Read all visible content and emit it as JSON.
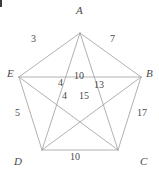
{
  "figure": {
    "shape": "regular-pentagon-with-all-diagonals",
    "stroke_color": "#a8a8a8",
    "text_color": "#4a4a4a",
    "background_color": "#ffffff",
    "vertices": [
      {
        "id": "A",
        "label": "A",
        "x": 80,
        "y": 33,
        "label_x": 76,
        "label_y": 5
      },
      {
        "id": "B",
        "label": "B",
        "x": 141,
        "y": 77,
        "label_x": 146,
        "label_y": 68
      },
      {
        "id": "C",
        "label": "C",
        "x": 118,
        "y": 150,
        "label_x": 140,
        "label_y": 156
      },
      {
        "id": "D",
        "label": "D",
        "x": 42,
        "y": 150,
        "label_x": 14,
        "label_y": 156
      },
      {
        "id": "E",
        "label": "E",
        "x": 19,
        "y": 77,
        "label_x": 7,
        "label_y": 68
      }
    ],
    "sides": [
      {
        "from": "E",
        "to": "A",
        "length": "3",
        "label_x": 31,
        "label_y": 34
      },
      {
        "from": "A",
        "to": "B",
        "length": "7",
        "label_x": 110,
        "label_y": 34
      },
      {
        "from": "B",
        "to": "C",
        "length": "17",
        "label_x": 137,
        "label_y": 108
      },
      {
        "from": "C",
        "to": "D",
        "length": "10",
        "label_x": 70,
        "label_y": 152
      },
      {
        "from": "D",
        "to": "E",
        "length": "5",
        "label_x": 15,
        "label_y": 108
      }
    ],
    "diagonals": [
      {
        "from": "A",
        "to": "C",
        "length": "13",
        "label_x": 94,
        "label_y": 80
      },
      {
        "from": "A",
        "to": "D",
        "length": "10",
        "label_x": 74,
        "label_y": 71
      },
      {
        "from": "B",
        "to": "D",
        "length": "15",
        "label_x": 79,
        "label_y": 91
      },
      {
        "from": "B",
        "to": "E",
        "length": "4",
        "label_x": 62,
        "label_y": 91
      },
      {
        "from": "C",
        "to": "E",
        "length": "4",
        "label_x": 58,
        "label_y": 78
      }
    ]
  },
  "chart_data": {
    "type": "diagram",
    "node_labels": [
      "A",
      "B",
      "C",
      "D",
      "E"
    ],
    "edges": [
      {
        "pair": "EA",
        "value": 3
      },
      {
        "pair": "AB",
        "value": 7
      },
      {
        "pair": "BC",
        "value": 17
      },
      {
        "pair": "CD",
        "value": 10
      },
      {
        "pair": "DE",
        "value": 5
      },
      {
        "pair": "AC",
        "value": 13
      },
      {
        "pair": "AD",
        "value": 10
      },
      {
        "pair": "BD",
        "value": 15
      },
      {
        "pair": "BE",
        "value": 4
      },
      {
        "pair": "CE",
        "value": 4
      }
    ],
    "annotations": [
      "3",
      "7",
      "17",
      "10",
      "5",
      "10",
      "4",
      "13",
      "4",
      "15"
    ]
  }
}
